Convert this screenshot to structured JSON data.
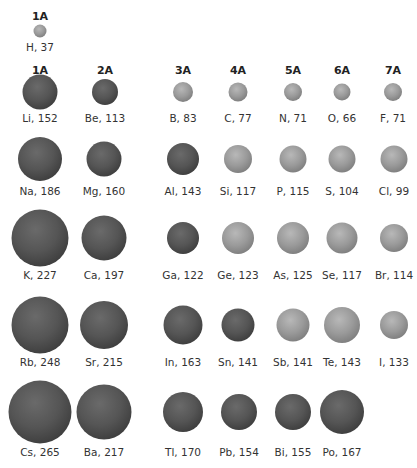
{
  "headers": {
    "h": "1A",
    "g1": "1A",
    "g2": "2A",
    "g3": "3A",
    "g4": "4A",
    "g5": "5A",
    "g6": "6A",
    "g7": "7A"
  },
  "elements": {
    "H": {
      "label": "H, 37",
      "radius": 37,
      "type": "nonmetal"
    },
    "Li": {
      "label": "Li, 152",
      "radius": 152,
      "type": "metal"
    },
    "Be": {
      "label": "Be, 113",
      "radius": 113,
      "type": "metal"
    },
    "B": {
      "label": "B, 83",
      "radius": 83,
      "type": "nonmetal"
    },
    "C": {
      "label": "C, 77",
      "radius": 77,
      "type": "nonmetal"
    },
    "N": {
      "label": "N, 71",
      "radius": 71,
      "type": "nonmetal"
    },
    "O": {
      "label": "O, 66",
      "radius": 66,
      "type": "nonmetal"
    },
    "F": {
      "label": "F, 71",
      "radius": 71,
      "type": "nonmetal"
    },
    "Na": {
      "label": "Na, 186",
      "radius": 186,
      "type": "metal"
    },
    "Mg": {
      "label": "Mg, 160",
      "radius": 160,
      "type": "metal"
    },
    "Al": {
      "label": "Al, 143",
      "radius": 143,
      "type": "metal"
    },
    "Si": {
      "label": "Si, 117",
      "radius": 117,
      "type": "nonmetal"
    },
    "P": {
      "label": "P, 115",
      "radius": 115,
      "type": "nonmetal"
    },
    "S": {
      "label": "S, 104",
      "radius": 104,
      "type": "nonmetal"
    },
    "Cl": {
      "label": "Cl, 99",
      "radius": 99,
      "type": "nonmetal"
    },
    "K": {
      "label": "K, 227",
      "radius": 227,
      "type": "metal"
    },
    "Ca": {
      "label": "Ca, 197",
      "radius": 197,
      "type": "metal"
    },
    "Ga": {
      "label": "Ga, 122",
      "radius": 122,
      "type": "metal"
    },
    "Ge": {
      "label": "Ge, 123",
      "radius": 123,
      "type": "nonmetal"
    },
    "As": {
      "label": "As, 125",
      "radius": 125,
      "type": "nonmetal"
    },
    "Se": {
      "label": "Se, 117",
      "radius": 117,
      "type": "nonmetal"
    },
    "Br": {
      "label": "Br, 114",
      "radius": 114,
      "type": "nonmetal"
    },
    "Rb": {
      "label": "Rb, 248",
      "radius": 248,
      "type": "metal"
    },
    "Sr": {
      "label": "Sr, 215",
      "radius": 215,
      "type": "metal"
    },
    "In": {
      "label": "In, 163",
      "radius": 163,
      "type": "metal"
    },
    "Sn": {
      "label": "Sn, 141",
      "radius": 141,
      "type": "metal"
    },
    "Sb": {
      "label": "Sb, 141",
      "radius": 141,
      "type": "nonmetal"
    },
    "Te": {
      "label": "Te, 143",
      "radius": 143,
      "type": "nonmetal"
    },
    "I": {
      "label": "I, 133",
      "radius": 133,
      "type": "nonmetal"
    },
    "Cs": {
      "label": "Cs, 265",
      "radius": 265,
      "type": "metal"
    },
    "Ba": {
      "label": "Ba, 217",
      "radius": 217,
      "type": "metal"
    },
    "Tl": {
      "label": "Tl, 170",
      "radius": 170,
      "type": "metal"
    },
    "Pb": {
      "label": "Pb, 154",
      "radius": 154,
      "type": "metal"
    },
    "Bi": {
      "label": "Bi, 155",
      "radius": 155,
      "type": "metal"
    },
    "Po": {
      "label": "Po, 167",
      "radius": 167,
      "type": "metal"
    }
  },
  "colors": {
    "metal": "#4a4a4a",
    "nonmetal": "#8e8e8e",
    "background": "#ffffff"
  }
}
